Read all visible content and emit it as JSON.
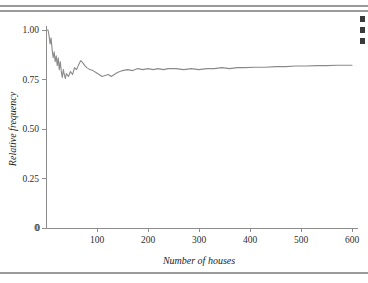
{
  "figure": {
    "rules": [
      "top-rule-upper",
      "top-rule-lower",
      "bottom-rule"
    ],
    "margin_marks": [
      "clipped-mark-1",
      "clipped-mark-2",
      "clipped-mark-3"
    ]
  },
  "chart_data": {
    "type": "line",
    "title": "",
    "subtitle": "",
    "xlabel": "Number of houses",
    "ylabel": "Relative frequency",
    "xlim": [
      0,
      600
    ],
    "ylim": [
      0,
      1.0
    ],
    "grid": false,
    "legend": "none",
    "xticks": [
      0,
      100,
      200,
      300,
      400,
      500,
      600
    ],
    "xtick_labels": [
      "0",
      "100",
      "200",
      "300",
      "400",
      "500",
      "600"
    ],
    "yticks": [
      0,
      0.25,
      0.5,
      0.75,
      1.0
    ],
    "ytick_labels": [
      "0",
      "0.25",
      "0.50",
      "0.75",
      "1.00"
    ],
    "line_color": "#8a8a8a",
    "axis_color": "#8d8d8d",
    "series": [
      {
        "name": "Running relative frequency",
        "x": [
          2,
          4,
          6,
          8,
          10,
          12,
          14,
          16,
          18,
          20,
          22,
          24,
          26,
          28,
          30,
          32,
          34,
          36,
          38,
          40,
          44,
          48,
          52,
          56,
          60,
          64,
          68,
          72,
          76,
          80,
          86,
          92,
          98,
          104,
          110,
          116,
          122,
          128,
          134,
          140,
          150,
          160,
          170,
          180,
          190,
          200,
          210,
          220,
          230,
          240,
          255,
          270,
          285,
          300,
          315,
          330,
          345,
          360,
          375,
          390,
          410,
          430,
          450,
          470,
          490,
          510,
          530,
          550,
          570,
          590,
          600
        ],
        "y": [
          1.0,
          1.0,
          0.97,
          0.93,
          0.96,
          0.9,
          0.86,
          0.89,
          0.84,
          0.87,
          0.82,
          0.86,
          0.8,
          0.84,
          0.79,
          0.76,
          0.8,
          0.775,
          0.755,
          0.78,
          0.765,
          0.79,
          0.775,
          0.81,
          0.8,
          0.825,
          0.845,
          0.835,
          0.82,
          0.81,
          0.8,
          0.795,
          0.785,
          0.775,
          0.765,
          0.77,
          0.775,
          0.765,
          0.775,
          0.785,
          0.795,
          0.8,
          0.795,
          0.805,
          0.8,
          0.805,
          0.8,
          0.805,
          0.8,
          0.805,
          0.805,
          0.8,
          0.805,
          0.8,
          0.805,
          0.805,
          0.81,
          0.805,
          0.81,
          0.81,
          0.812,
          0.812,
          0.815,
          0.815,
          0.818,
          0.818,
          0.82,
          0.82,
          0.822,
          0.822,
          0.822
        ]
      }
    ]
  }
}
